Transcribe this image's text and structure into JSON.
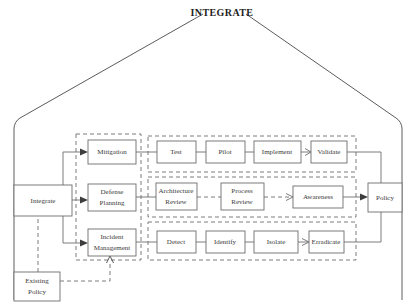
{
  "title": "INTEGRATE",
  "nodes": {
    "integrate": "Integrate",
    "existing_policy_l1": "Existing",
    "existing_policy_l2": "Policy",
    "mitigation": "Mitigation",
    "defense_l1": "Defense",
    "defense_l2": "Planning",
    "incident_l1": "Incident",
    "incident_l2": "Management",
    "test": "Test",
    "pilot": "Pilot",
    "implement": "Implement",
    "validate": "Validate",
    "architecture_l1": "Architecture",
    "architecture_l2": "Review",
    "process_l1": "Process",
    "process_l2": "Review",
    "awareness": "Awareness",
    "detect": "Detect",
    "identify": "Identify",
    "isolate": "Isolate",
    "erradicate": "Erradicate",
    "policy": "Policy"
  },
  "colors": {
    "stroke": "#6d6d6d",
    "text": "#3b3b3b",
    "title": "#1d1d1d",
    "background": "#ffffff"
  }
}
